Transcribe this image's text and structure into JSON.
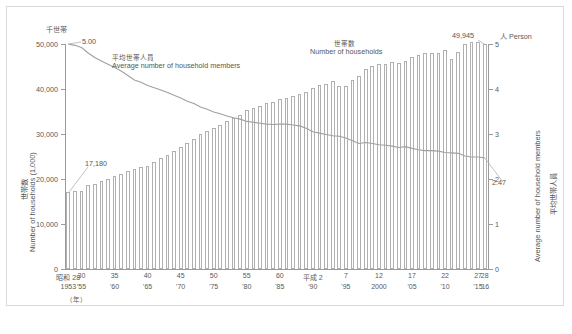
{
  "figure": {
    "left_unit": "千世帯",
    "right_unit": "人 Person",
    "left_axis_title_jp": "世帯数",
    "left_axis_title_en": "Number of households (1,000)",
    "right_axis_title_en": "Average number of household members",
    "right_axis_title_jp": "平均世帯人員",
    "x_note": "（年）",
    "caption": ""
  },
  "annotations": {
    "line_label_jp": "平均世帯人員",
    "line_label_en": "Average number of household members",
    "bar_label_jp": "世帯数",
    "bar_label_en": "Number of households",
    "first_bar_value": "17,180",
    "last_bar_value": "49,945",
    "first_line_value": "5.00",
    "last_line_value": "2.47"
  },
  "colors": {
    "bar_stroke": "#b0b0b0",
    "bar_fill": "#ffffff",
    "line": "#a0a0a0",
    "axis": "#9b9b9b",
    "text": "#5a5a5a",
    "frame": "#d9d9d9"
  },
  "chart_data": {
    "type": "bar",
    "title": "",
    "xlabel": "（年）",
    "ylabel": "Number of households (1,000)",
    "y2label": "Average number of household members (Person)",
    "ylim": [
      0,
      50000
    ],
    "y2lim": [
      0,
      5
    ],
    "yticks": [
      0,
      10000,
      20000,
      30000,
      40000,
      50000
    ],
    "ytick_labels": [
      "0",
      "10,000",
      "20,000",
      "30,000",
      "40,000",
      "50,000"
    ],
    "y2ticks": [
      0,
      1,
      2,
      3,
      4,
      5
    ],
    "y2tick_labels": [
      "0",
      "1",
      "2",
      "3",
      "4",
      "5"
    ],
    "grid": false,
    "legend": "inline-annotations",
    "x": [
      1953,
      1954,
      1955,
      1956,
      1957,
      1958,
      1959,
      1960,
      1961,
      1962,
      1963,
      1964,
      1965,
      1966,
      1967,
      1968,
      1969,
      1970,
      1971,
      1972,
      1973,
      1974,
      1975,
      1976,
      1977,
      1978,
      1979,
      1980,
      1981,
      1982,
      1983,
      1984,
      1985,
      1986,
      1987,
      1988,
      1989,
      1990,
      1991,
      1992,
      1993,
      1994,
      1995,
      1996,
      1997,
      1998,
      1999,
      2000,
      2001,
      2002,
      2003,
      2004,
      2005,
      2006,
      2007,
      2008,
      2009,
      2010,
      2011,
      2012,
      2013,
      2014,
      2015,
      2016
    ],
    "x_major_ticks": [
      {
        "x": 1953,
        "era": "昭和 28",
        "year": "1953"
      },
      {
        "x": 1955,
        "era": "30",
        "year": "'55"
      },
      {
        "x": 1960,
        "era": "35",
        "year": "'60"
      },
      {
        "x": 1965,
        "era": "40",
        "year": "'65"
      },
      {
        "x": 1970,
        "era": "45",
        "year": "'70"
      },
      {
        "x": 1975,
        "era": "50",
        "year": "'75"
      },
      {
        "x": 1980,
        "era": "55",
        "year": "'80"
      },
      {
        "x": 1985,
        "era": "60",
        "year": "'85"
      },
      {
        "x": 1990,
        "era": "平成 2",
        "year": "'90"
      },
      {
        "x": 1995,
        "era": "7",
        "year": "'95"
      },
      {
        "x": 2000,
        "era": "12",
        "year": "2000"
      },
      {
        "x": 2005,
        "era": "17",
        "year": "'05"
      },
      {
        "x": 2010,
        "era": "22",
        "year": "'10"
      },
      {
        "x": 2015,
        "era": "27",
        "year": "'15"
      },
      {
        "x": 2016,
        "era": "28",
        "year": "'16"
      }
    ],
    "series": [
      {
        "name": "世帯数 Number of households",
        "unit": "1,000 households",
        "axis": "left",
        "render": "bar",
        "values": [
          17180,
          17382,
          17383,
          18700,
          19000,
          19500,
          20100,
          20700,
          21100,
          21700,
          22300,
          22650,
          23000,
          23800,
          24600,
          25400,
          26200,
          27100,
          28000,
          29000,
          30000,
          30600,
          31300,
          32000,
          32800,
          33600,
          34300,
          35300,
          35800,
          36200,
          36800,
          37200,
          37700,
          38100,
          38500,
          38900,
          39400,
          40273,
          40900,
          41200,
          41800,
          40700,
          40770,
          42100,
          42800,
          44500,
          45100,
          45545,
          45664,
          46005,
          45800,
          46323,
          47043,
          47500,
          48023,
          47957,
          48013,
          48638,
          46684,
          48166,
          50112,
          50431,
          50361,
          49945
        ]
      },
      {
        "name": "平均世帯人員 Average number of household members",
        "unit": "persons",
        "axis": "right",
        "render": "line",
        "values": [
          5.0,
          4.97,
          4.92,
          4.8,
          4.7,
          4.62,
          4.55,
          4.48,
          4.4,
          4.3,
          4.2,
          4.15,
          4.08,
          4.03,
          3.98,
          3.92,
          3.86,
          3.8,
          3.73,
          3.68,
          3.6,
          3.55,
          3.49,
          3.45,
          3.4,
          3.36,
          3.33,
          3.28,
          3.26,
          3.24,
          3.22,
          3.21,
          3.22,
          3.22,
          3.2,
          3.18,
          3.13,
          3.05,
          3.02,
          2.99,
          2.96,
          2.95,
          2.91,
          2.85,
          2.79,
          2.81,
          2.79,
          2.76,
          2.75,
          2.73,
          2.7,
          2.72,
          2.68,
          2.65,
          2.63,
          2.63,
          2.62,
          2.59,
          2.58,
          2.57,
          2.51,
          2.49,
          2.49,
          2.47
        ]
      }
    ]
  }
}
